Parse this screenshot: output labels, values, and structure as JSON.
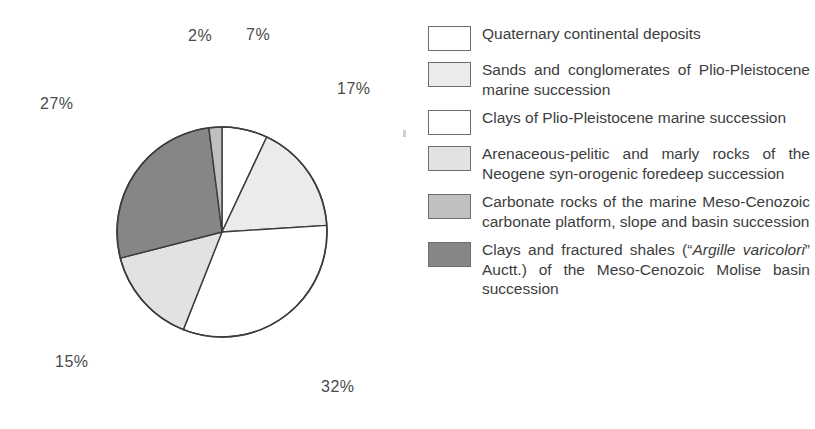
{
  "chart_data": {
    "type": "pie",
    "title": "",
    "legend_position": "right",
    "unit": "%",
    "start_angle_deg": 0,
    "direction": "clockwise",
    "center": {
      "x": 222,
      "y": 232
    },
    "radius": 105,
    "categories": [
      "Quaternary continental deposits",
      "Sands and conglomerates of Plio-Pleistocene marine succession",
      "Clays of Plio-Pleistocene marine succession",
      "Arenaceous-pelitic and marly rocks of the Neogene syn-orogenic foredeep succession",
      "Carbonate rocks of the marine Meso-Cenozoic carbonate platform, slope and basin succession",
      "Clays and fractured shales (\"Argille varicolori\" Auctt.) of the Meso-Cenozoic Molise basin succession"
    ],
    "values": [
      7,
      17,
      32,
      15,
      2,
      27
    ],
    "colors": [
      "#ffffff",
      "#ebebeb",
      "#ffffff",
      "#e2e2e2",
      "#c0c0c0",
      "#868686"
    ],
    "slice_order_clockwise_from_top": [
      {
        "label": "7%",
        "value": 7,
        "color": "#ffffff"
      },
      {
        "label": "17%",
        "value": 17,
        "color": "#ebebeb"
      },
      {
        "label": "32%",
        "value": 32,
        "color": "#ffffff"
      },
      {
        "label": "15%",
        "value": 15,
        "color": "#e2e2e2"
      },
      {
        "label": "27%",
        "value": 27,
        "color": "#868686"
      },
      {
        "label": "2%",
        "value": 2,
        "color": "#c0c0c0"
      }
    ]
  },
  "pie": {
    "stroke_color": "#3c3c3c",
    "labels": [
      {
        "text": "2%",
        "left": 188,
        "top": 27
      },
      {
        "text": "7%",
        "left": 246,
        "top": 26
      },
      {
        "text": "17%",
        "left": 337,
        "top": 80
      },
      {
        "text": "27%",
        "left": 40,
        "top": 95
      },
      {
        "text": "15%",
        "left": 55,
        "top": 353
      },
      {
        "text": "32%",
        "left": 321,
        "top": 378
      }
    ]
  },
  "legend": {
    "items": [
      {
        "swatch_color": "#ffffff",
        "text_html": "Quaternary continental deposits",
        "plain": "Quaternary continental deposits",
        "value": 7
      },
      {
        "swatch_color": "#ebebeb",
        "text_html": "Sands and conglomerates of Plio-Pleistocene marine succession",
        "plain": "Sands and conglomerates of Plio-Pleistocene marine succession",
        "value": 17
      },
      {
        "swatch_color": "#ffffff",
        "text_html": "Clays of Plio-Pleistocene marine succession",
        "plain": "Clays of Plio-Pleistocene marine succession",
        "value": 32
      },
      {
        "swatch_color": "#e2e2e2",
        "text_html": "Arenaceous-pelitic and marly rocks of the Neogene syn-orogenic foredeep succession",
        "plain": "Arenaceous-pelitic and marly rocks of the Neogene syn-orogenic foredeep succession",
        "value": 15
      },
      {
        "swatch_color": "#c0c0c0",
        "text_html": "Carbonate rocks of the marine Meso-Cenozoic carbonate platform, slope and basin succession",
        "plain": "Carbonate rocks of the marine Meso-Cenozoic carbonate platform, slope and basin succession",
        "value": 2
      },
      {
        "swatch_color": "#868686",
        "text_html": "Clays and fractured shales (“<i>Argille varicolori</i>” Auctt.) of the Meso-Cenozoic Molise basin succession",
        "plain": "Clays and fractured shales (“Argille varicolori” Auctt.) of the Meso-Cenozoic Molise basin succession",
        "value": 27
      }
    ]
  }
}
